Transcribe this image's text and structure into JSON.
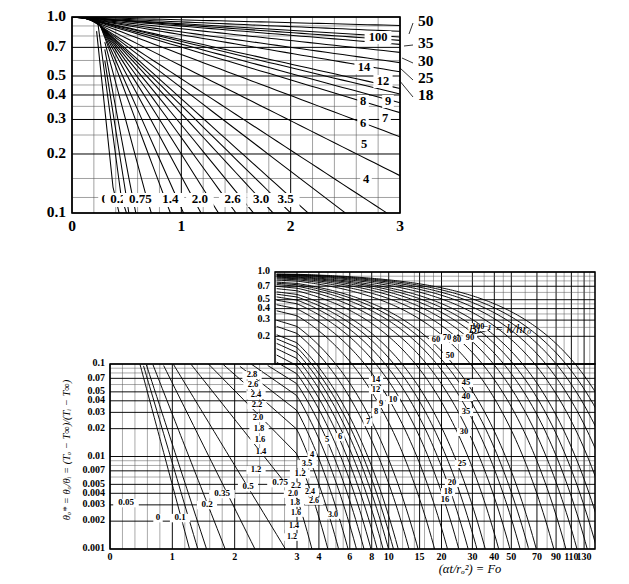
{
  "figure": {
    "type": "heisler-chart",
    "axis_label_x": "(αt/rₒ²) = Fo",
    "axis_label_y": "θₒ* = θₒ/θᵢ = (Tₒ − T∞)/(Tᵢ − T∞)",
    "annotation": "Bi⁻¹ = k/hrₒ",
    "line_color": "#000000",
    "grid_color": "#555555",
    "background": "#ffffff"
  },
  "chart_data": [
    {
      "id": "top-inset",
      "type": "line",
      "title": "",
      "xlabel": "",
      "ylabel": "",
      "xlim": [
        0,
        3
      ],
      "ylim": [
        0.1,
        1.0
      ],
      "xscale": "linear",
      "yscale": "log",
      "grid": true,
      "legend": "inline-curve-labels",
      "xticks": [
        0,
        1,
        2,
        3
      ],
      "xticklabels": [
        "0",
        "1",
        "2",
        "3"
      ],
      "yticks": [
        0.1,
        0.2,
        0.3,
        0.4,
        0.5,
        0.7,
        1.0
      ],
      "yticklabels": [
        "0.1",
        "0.2",
        "0.3",
        "0.4",
        "0.5",
        "0.7",
        "1.0"
      ],
      "curve_labels_inside": [
        "100",
        "14",
        "12",
        "8",
        "9",
        "7",
        "6",
        "5",
        "4"
      ],
      "curve_labels_bottom": [
        "0",
        "0.2",
        "0.75",
        "1.4",
        "2.0",
        "2.6",
        "3.0",
        "3.5"
      ],
      "curve_labels_right": [
        "50",
        "35",
        "30",
        "25",
        "18"
      ],
      "series": [
        {
          "name": "0",
          "x": [
            0.22,
            0.4
          ],
          "y": [
            0.9,
            0.1
          ]
        },
        {
          "name": "0.2",
          "x": [
            0.24,
            0.47
          ],
          "y": [
            0.9,
            0.1
          ]
        },
        {
          "name": "0.35",
          "x": [
            0.25,
            0.52
          ],
          "y": [
            0.9,
            0.1
          ]
        },
        {
          "name": "0.5",
          "x": [
            0.26,
            0.58
          ],
          "y": [
            0.9,
            0.1
          ]
        },
        {
          "name": "0.75",
          "x": [
            0.26,
            0.72
          ],
          "y": [
            0.9,
            0.1
          ]
        },
        {
          "name": "1.0",
          "x": [
            0.26,
            0.9
          ],
          "y": [
            0.9,
            0.1
          ]
        },
        {
          "name": "1.2",
          "x": [
            0.26,
            1.02
          ],
          "y": [
            0.9,
            0.1
          ]
        },
        {
          "name": "1.4",
          "x": [
            0.26,
            1.18
          ],
          "y": [
            0.9,
            0.1
          ]
        },
        {
          "name": "1.6",
          "x": [
            0.26,
            1.34
          ],
          "y": [
            0.9,
            0.1
          ]
        },
        {
          "name": "1.8",
          "x": [
            0.26,
            1.5
          ],
          "y": [
            0.9,
            0.1
          ]
        },
        {
          "name": "2.0",
          "x": [
            0.26,
            1.66
          ],
          "y": [
            0.9,
            0.1
          ]
        },
        {
          "name": "2.2",
          "x": [
            0.26,
            1.84
          ],
          "y": [
            0.9,
            0.1
          ]
        },
        {
          "name": "2.4",
          "x": [
            0.26,
            2.0
          ],
          "y": [
            0.9,
            0.1
          ]
        },
        {
          "name": "2.6",
          "x": [
            0.26,
            2.16
          ],
          "y": [
            0.9,
            0.1
          ]
        },
        {
          "name": "3.0",
          "x": [
            0.26,
            2.5
          ],
          "y": [
            0.9,
            0.1
          ]
        },
        {
          "name": "3.5",
          "x": [
            0.26,
            2.88
          ],
          "y": [
            0.9,
            0.1
          ]
        },
        {
          "name": "4",
          "x": [
            0.24,
            3.0
          ],
          "y": [
            0.92,
            0.155
          ]
        },
        {
          "name": "5",
          "x": [
            0.24,
            3.0
          ],
          "y": [
            0.93,
            0.245
          ]
        },
        {
          "name": "6",
          "x": [
            0.24,
            3.0
          ],
          "y": [
            0.94,
            0.325
          ]
        },
        {
          "name": "7",
          "x": [
            0.24,
            3.0
          ],
          "y": [
            0.945,
            0.365
          ]
        },
        {
          "name": "8",
          "x": [
            0.24,
            3.0
          ],
          "y": [
            0.95,
            0.405
          ]
        },
        {
          "name": "9",
          "x": [
            0.24,
            3.0
          ],
          "y": [
            0.952,
            0.432
          ]
        },
        {
          "name": "12",
          "x": [
            0.24,
            3.0
          ],
          "y": [
            0.958,
            0.525
          ]
        },
        {
          "name": "14",
          "x": [
            0.24,
            3.0
          ],
          "y": [
            0.962,
            0.585
          ]
        },
        {
          "name": "18",
          "x": [
            0.24,
            3.0
          ],
          "y": [
            0.968,
            0.66
          ]
        },
        {
          "name": "25",
          "x": [
            0.24,
            3.0
          ],
          "y": [
            0.975,
            0.725
          ]
        },
        {
          "name": "30",
          "x": [
            0.24,
            3.0
          ],
          "y": [
            0.978,
            0.76
          ]
        },
        {
          "name": "35",
          "x": [
            0.24,
            3.0
          ],
          "y": [
            0.98,
            0.79
          ]
        },
        {
          "name": "50",
          "x": [
            0.24,
            3.0
          ],
          "y": [
            0.985,
            0.845
          ]
        },
        {
          "name": "100",
          "x": [
            0.24,
            3.0
          ],
          "y": [
            0.992,
            0.905
          ]
        }
      ]
    },
    {
      "id": "main-chart",
      "type": "line",
      "title": "",
      "xlabel": "(αt/rₒ²) = Fo",
      "ylabel": "θₒ* = θₒ/θᵢ = (Tₒ − T∞)/(Tᵢ − T∞)",
      "annotation": "Bi⁻¹ = k/hrₒ",
      "xscale": "piecewise: linear 0-3, log 3-150",
      "yscale": "log",
      "ylim_lower": [
        0.001,
        0.1
      ],
      "ylim_upper": [
        0.2,
        1.0
      ],
      "grid": true,
      "xticks": [
        0,
        1,
        2,
        3,
        4,
        6,
        8,
        10,
        15,
        20,
        30,
        40,
        50,
        70,
        90,
        110,
        130
      ],
      "xticklabels": [
        "0",
        "1",
        "2",
        "3",
        "4",
        "6",
        "8",
        "10",
        "15",
        "20",
        "30",
        "40",
        "50",
        "70",
        "90",
        "110",
        "130"
      ],
      "yticks_lower": [
        0.001,
        0.002,
        0.003,
        0.004,
        0.005,
        0.007,
        0.01,
        0.02,
        0.03,
        0.04,
        0.05,
        0.07,
        0.1
      ],
      "yticklabels_lower": [
        "0.001",
        "0.002",
        "0.003",
        "0.004",
        "0.005",
        "0.007",
        "0.01",
        "0.02",
        "0.03",
        "0.04",
        "0.05",
        "0.07",
        "0.1"
      ],
      "yticks_upper": [
        0.2,
        0.3,
        0.4,
        0.5,
        0.7,
        1.0
      ],
      "yticklabels_upper": [
        "0.2",
        "0.3",
        "0.4",
        "0.5",
        "0.7",
        "1.0"
      ],
      "curve_labels_left_low": [
        "0.05",
        "0",
        "0.1",
        "0.2",
        "0.35",
        "0.5",
        "0.75",
        "1.2"
      ],
      "curve_labels_mid_upper": [
        "2.8",
        "2.6",
        "2.4",
        "2.2",
        "2.0",
        "1.8",
        "1.6",
        "1.4",
        "1.2"
      ],
      "curve_labels_mid_low": [
        "2.2",
        "2.0",
        "2.4",
        "1.8",
        "2.6",
        "1.6",
        "3.0",
        "1.4",
        "1.2"
      ],
      "curve_labels_center": [
        "14",
        "12",
        "10",
        "9",
        "8",
        "7",
        "6",
        "5",
        "4",
        "3.5"
      ],
      "curve_labels_right": [
        "100",
        "90",
        "80",
        "70",
        "60",
        "50",
        "45",
        "40",
        "35",
        "30",
        "25",
        "20",
        "18",
        "16"
      ],
      "series_biot_inverse": [
        0,
        0.05,
        0.1,
        0.2,
        0.35,
        0.5,
        0.75,
        1.0,
        1.2,
        1.4,
        1.6,
        1.8,
        2.0,
        2.2,
        2.4,
        2.6,
        2.8,
        3.0,
        3.5,
        4,
        5,
        6,
        7,
        8,
        9,
        10,
        12,
        14,
        16,
        18,
        20,
        25,
        30,
        35,
        40,
        45,
        50,
        60,
        70,
        80,
        90,
        100
      ]
    }
  ]
}
